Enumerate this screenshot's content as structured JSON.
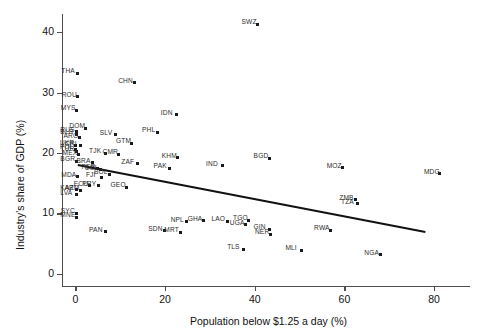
{
  "chart_data": {
    "type": "scatter",
    "title": "",
    "xlabel": "Population below $1.25 a day (%)",
    "ylabel": "Industry's share of GDP (%)",
    "xlim": [
      -3,
      88
    ],
    "ylim": [
      -2,
      43
    ],
    "xticks": [
      0,
      20,
      40,
      60,
      80
    ],
    "yticks": [
      0,
      10,
      20,
      30,
      40
    ],
    "grid": false,
    "legend": "none",
    "point_label_field": "code",
    "trendline": {
      "type": "linear",
      "x_start": 0.5,
      "y_start": 18.2,
      "x_end": 78.0,
      "y_end": 7.1,
      "color": "#111111"
    },
    "points": [
      {
        "code": "SWZ",
        "x": 40.6,
        "y": 41.3
      },
      {
        "code": "THA",
        "x": 0.4,
        "y": 33.2
      },
      {
        "code": "CHN",
        "x": 13.1,
        "y": 31.6
      },
      {
        "code": "ROU",
        "x": 0.5,
        "y": 29.3
      },
      {
        "code": "MYS",
        "x": 0.3,
        "y": 27.1
      },
      {
        "code": "IDN",
        "x": 22.6,
        "y": 26.3
      },
      {
        "code": "DOM",
        "x": 2.2,
        "y": 24.1
      },
      {
        "code": "RUS",
        "x": 0.2,
        "y": 23.5
      },
      {
        "code": "BLR",
        "x": 0.2,
        "y": 23.1
      },
      {
        "code": "ARG",
        "x": 0.9,
        "y": 22.5
      },
      {
        "code": "PHL",
        "x": 18.4,
        "y": 23.4
      },
      {
        "code": "SLV",
        "x": 9.0,
        "y": 23.0
      },
      {
        "code": "GTM",
        "x": 12.6,
        "y": 21.6
      },
      {
        "code": "UKR",
        "x": 0.1,
        "y": 21.3
      },
      {
        "code": "CRI",
        "x": 1.2,
        "y": 21.2
      },
      {
        "code": "POL",
        "x": 0.1,
        "y": 20.6
      },
      {
        "code": "TUR",
        "x": 0.2,
        "y": 20.3
      },
      {
        "code": "MEX",
        "x": 0.7,
        "y": 19.7
      },
      {
        "code": "TJK",
        "x": 6.6,
        "y": 20.0
      },
      {
        "code": "CMR",
        "x": 9.6,
        "y": 19.8
      },
      {
        "code": "KHM",
        "x": 22.8,
        "y": 19.2
      },
      {
        "code": "BGD",
        "x": 43.3,
        "y": 19.1
      },
      {
        "code": "BGR",
        "x": 0.2,
        "y": 18.6
      },
      {
        "code": "BRA",
        "x": 3.8,
        "y": 18.4
      },
      {
        "code": "ZAF",
        "x": 13.8,
        "y": 18.2
      },
      {
        "code": "PAK",
        "x": 21.0,
        "y": 17.5
      },
      {
        "code": "IND",
        "x": 32.7,
        "y": 17.9
      },
      {
        "code": "MOZ",
        "x": 59.6,
        "y": 17.6
      },
      {
        "code": "MDG",
        "x": 81.3,
        "y": 16.6
      },
      {
        "code": "PER",
        "x": 4.9,
        "y": 17.4
      },
      {
        "code": "COL",
        "x": 5.6,
        "y": 17.2
      },
      {
        "code": "BOL",
        "x": 7.7,
        "y": 16.5
      },
      {
        "code": "MDA",
        "x": 0.4,
        "y": 16.1
      },
      {
        "code": "FJI",
        "x": 5.9,
        "y": 16.0
      },
      {
        "code": "ECU",
        "x": 3.2,
        "y": 14.6
      },
      {
        "code": "PRY",
        "x": 5.1,
        "y": 14.6
      },
      {
        "code": "GEO",
        "x": 11.4,
        "y": 14.3
      },
      {
        "code": "KAZ",
        "x": 0.2,
        "y": 13.9
      },
      {
        "code": "ARM",
        "x": 1.1,
        "y": 13.8
      },
      {
        "code": "LVA",
        "x": 0.2,
        "y": 13.1
      },
      {
        "code": "ZMB",
        "x": 62.4,
        "y": 12.3
      },
      {
        "code": "TZA",
        "x": 62.8,
        "y": 11.6
      },
      {
        "code": "SYC",
        "x": 0.3,
        "y": 10.0
      },
      {
        "code": "MNE",
        "x": 0.2,
        "y": 9.4
      },
      {
        "code": "NPL",
        "x": 24.8,
        "y": 8.6
      },
      {
        "code": "GHA",
        "x": 28.6,
        "y": 8.8
      },
      {
        "code": "LAO",
        "x": 33.9,
        "y": 8.7
      },
      {
        "code": "TGO",
        "x": 38.7,
        "y": 8.9
      },
      {
        "code": "UGA",
        "x": 38.0,
        "y": 8.1
      },
      {
        "code": "GIN",
        "x": 43.3,
        "y": 7.4
      },
      {
        "code": "NER",
        "x": 43.6,
        "y": 6.6
      },
      {
        "code": "RWA",
        "x": 56.8,
        "y": 7.2
      },
      {
        "code": "SDN",
        "x": 19.8,
        "y": 7.1
      },
      {
        "code": "MRT",
        "x": 23.4,
        "y": 6.9
      },
      {
        "code": "PAN",
        "x": 6.6,
        "y": 7.0
      },
      {
        "code": "TLS",
        "x": 37.4,
        "y": 4.1
      },
      {
        "code": "MLI",
        "x": 50.4,
        "y": 3.9
      },
      {
        "code": "NGA",
        "x": 68.0,
        "y": 3.2
      }
    ]
  }
}
